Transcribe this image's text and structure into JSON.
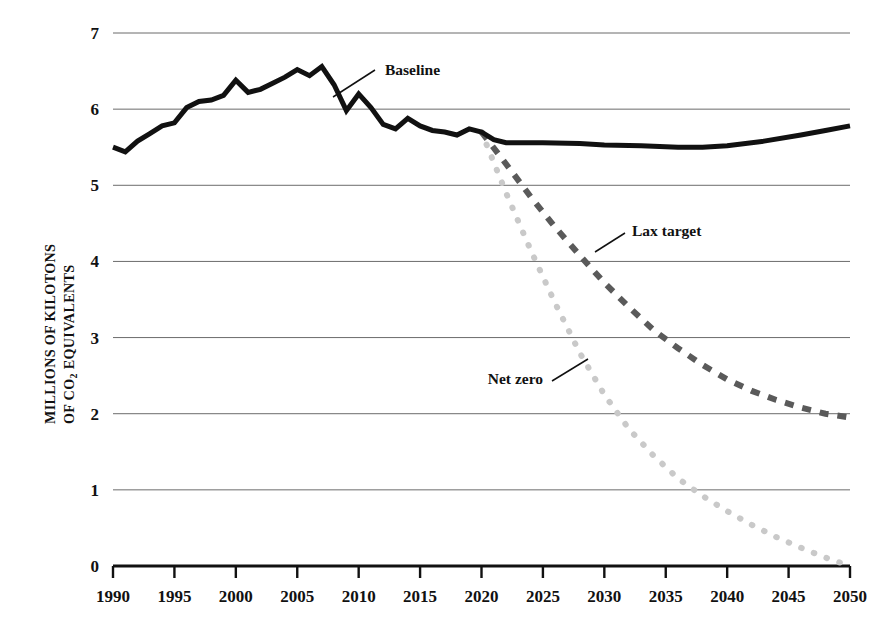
{
  "chart_data": {
    "type": "line",
    "title": "",
    "xlabel": "",
    "ylabel": "MILLIONS OF KILOTONS OF CO2 EQUIVALENTS",
    "ylabel_line1": "MILLIONS OF KILOTONS",
    "ylabel_line2_pre": "OF CO",
    "ylabel_line2_sub": "2",
    "ylabel_line2_post": " EQUIVALENTS",
    "xlim": [
      1990,
      2050
    ],
    "ylim": [
      0,
      7
    ],
    "grid": true,
    "legend_position": "inline-annotations",
    "y_ticks": [
      "0",
      "1",
      "2",
      "3",
      "4",
      "5",
      "6",
      "7"
    ],
    "y_tick_values": [
      0,
      1,
      2,
      3,
      4,
      5,
      6,
      7
    ],
    "x_ticks": [
      "1990",
      "1995",
      "2000",
      "2005",
      "2010",
      "2015",
      "2020",
      "2025",
      "2030",
      "2035",
      "2040",
      "2045",
      "2050"
    ],
    "x_tick_values": [
      1990,
      1995,
      2000,
      2005,
      2010,
      2015,
      2020,
      2025,
      2030,
      2035,
      2040,
      2045,
      2050
    ],
    "series": [
      {
        "name": "Baseline",
        "style": "solid",
        "color": "#111111",
        "width": 5,
        "x": [
          1990,
          1991,
          1992,
          1993,
          1994,
          1995,
          1996,
          1997,
          1998,
          1999,
          2000,
          2001,
          2002,
          2003,
          2004,
          2005,
          2006,
          2007,
          2008,
          2009,
          2010,
          2011,
          2012,
          2013,
          2014,
          2015,
          2016,
          2017,
          2018,
          2019,
          2020,
          2021,
          2022,
          2023,
          2025,
          2028,
          2030,
          2033,
          2036,
          2038,
          2040,
          2043,
          2046,
          2048,
          2050
        ],
        "values": [
          5.5,
          5.44,
          5.58,
          5.68,
          5.78,
          5.82,
          6.02,
          6.1,
          6.12,
          6.18,
          6.38,
          6.22,
          6.26,
          6.34,
          6.42,
          6.52,
          6.44,
          6.56,
          6.32,
          5.98,
          6.2,
          6.02,
          5.8,
          5.74,
          5.88,
          5.78,
          5.72,
          5.7,
          5.66,
          5.74,
          5.7,
          5.6,
          5.56,
          5.56,
          5.56,
          5.55,
          5.53,
          5.52,
          5.5,
          5.5,
          5.52,
          5.58,
          5.66,
          5.72,
          5.78
        ]
      },
      {
        "name": "Lax target",
        "style": "dashed",
        "color": "#5a5a5a",
        "width": 6,
        "x": [
          2020,
          2022,
          2024,
          2026,
          2028,
          2030,
          2032,
          2034,
          2036,
          2038,
          2040,
          2042,
          2044,
          2046,
          2048,
          2050
        ],
        "values": [
          5.7,
          5.28,
          4.85,
          4.45,
          4.08,
          3.72,
          3.4,
          3.1,
          2.86,
          2.64,
          2.45,
          2.3,
          2.18,
          2.08,
          2.0,
          1.95
        ]
      },
      {
        "name": "Net zero",
        "style": "dotted",
        "color": "#c9c9c9",
        "width": 6,
        "x": [
          2020,
          2022,
          2024,
          2026,
          2028,
          2030,
          2032,
          2034,
          2036,
          2038,
          2040,
          2042,
          2044,
          2046,
          2048,
          2050
        ],
        "values": [
          5.7,
          4.9,
          4.15,
          3.45,
          2.8,
          2.25,
          1.8,
          1.45,
          1.15,
          0.92,
          0.72,
          0.54,
          0.38,
          0.24,
          0.11,
          0.0
        ]
      }
    ],
    "annotations": [
      {
        "name": "Baseline",
        "text": "Baseline",
        "text_x": 385,
        "text_y": 75,
        "leader_from_x": 375,
        "leader_from_y": 70,
        "leader_to_x": 333,
        "leader_to_y": 97
      },
      {
        "name": "Lax target",
        "text": "Lax target",
        "text_x": 632,
        "text_y": 236,
        "leader_from_x": 625,
        "leader_from_y": 233,
        "leader_to_x": 595,
        "leader_to_y": 252
      },
      {
        "name": "Net zero",
        "text": "Net zero",
        "text_x": 543,
        "text_y": 384,
        "leader_from_x": 552,
        "leader_from_y": 381,
        "leader_to_x": 588,
        "leader_to_y": 359
      }
    ]
  }
}
